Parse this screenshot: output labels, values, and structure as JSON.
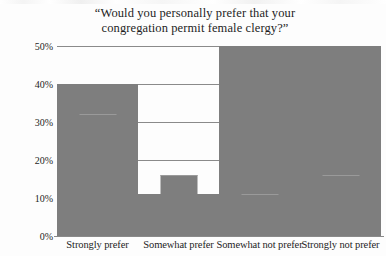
{
  "chart_data": {
    "type": "bar",
    "title": "“Would you personally prefer that your congregation permit female clergy?”",
    "title_lines": [
      "“Would you personally prefer that your",
      "congregation permit female clergy?”"
    ],
    "categories": [
      "Strongly prefer",
      "Somewhat prefer",
      "Somewhat not prefer",
      "Strongly not prefer"
    ],
    "values": [
      40,
      32,
      11,
      16
    ],
    "value_labels": [
      "40%",
      "32%",
      "11%",
      "16%"
    ],
    "xlabel": "",
    "ylabel": "",
    "ylim": [
      0,
      50
    ],
    "ytick_values": [
      0,
      10,
      20,
      30,
      40,
      50
    ],
    "ytick_labels": [
      "0%",
      "10%",
      "20%",
      "30%",
      "40%",
      "50%"
    ],
    "grid": true,
    "legend": false,
    "legend_position": "none",
    "series_name": "Share of respondents",
    "bar_color": "#7e7e7e",
    "grid_color": "#8a8a8a",
    "text_color": "#1d1d1d",
    "background_color": "#fdfdfd"
  }
}
